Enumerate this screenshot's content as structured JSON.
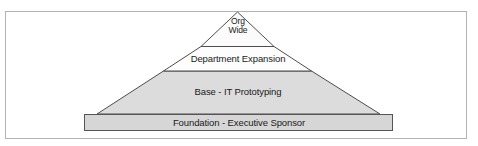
{
  "figure": {
    "kind": "pyramid-diagram",
    "background_color": "#ffffff",
    "frame_border_color": "#b3b3b3"
  },
  "pyramid": {
    "outline_color": "#4d4d4d",
    "tiers": [
      {
        "id": "apex",
        "label_lines": [
          "Org",
          "Wide"
        ],
        "label": "Org Wide",
        "fill_color": "#fbfbfb",
        "level": 1
      },
      {
        "id": "tier-2",
        "label": "Department Expansion",
        "fill_color": "#fdfdfd",
        "level": 2
      },
      {
        "id": "tier-3",
        "label": "Base - IT Prototyping",
        "fill_color": "#dcdcdc",
        "level": 3
      }
    ],
    "base_bar": {
      "id": "foundation",
      "label": "Foundation - Executive Sponsor",
      "fill_color": "#d6d6d6",
      "border_color": "#555555",
      "level": 4
    }
  }
}
